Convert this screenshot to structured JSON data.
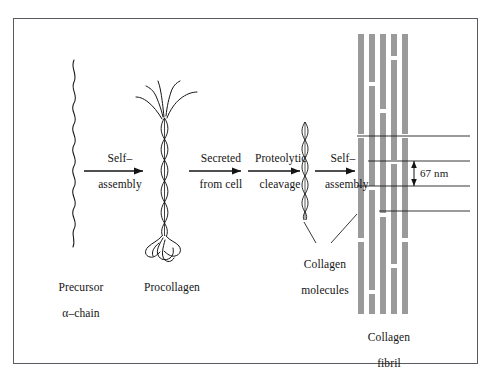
{
  "figure": {
    "type": "biological-process-diagram",
    "background_color": "#ffffff",
    "frame_color": "#5a5a60",
    "ink_color": "#141414",
    "fibril_bar_color": "#9a9a9a"
  },
  "stages": [
    {
      "id": "precursor",
      "label_line1": "Precursor",
      "label_line2": "α–chain",
      "glyph": "wavy-chain"
    },
    {
      "id": "procollagen",
      "label_line1": "Procollagen",
      "label_line2": "",
      "glyph": "triple-helix-with-frayed-ends"
    },
    {
      "id": "collagen-molecules",
      "label_line1": "Collagen",
      "label_line2": "molecules",
      "glyph": "triple-helix"
    },
    {
      "id": "collagen-fibril",
      "label_line1": "Collagen",
      "label_line2": "fibril",
      "glyph": "staggered-bar-array"
    }
  ],
  "arrows": [
    {
      "id": "self-assembly-1",
      "line1": "Self–",
      "line2": "assembly"
    },
    {
      "id": "secreted-from-cell",
      "line1": "Secreted",
      "line2": "from cell"
    },
    {
      "id": "proteolytic-cleavage",
      "line1": "Proteolytic",
      "line2": "cleavage"
    },
    {
      "id": "self-assembly-2",
      "line1": "Self–",
      "line2": "assembly"
    }
  ],
  "annotations": {
    "periodicity": {
      "value": "67 nm",
      "description": "D-period banding spacing of the collagen fibril"
    }
  }
}
